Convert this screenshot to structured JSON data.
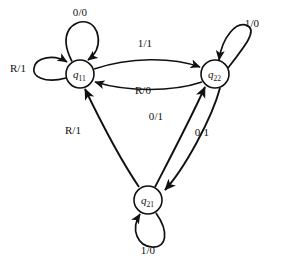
{
  "diagram": {
    "type": "finite-state-machine",
    "title": "",
    "background_color": "#ffffff",
    "stroke_color": "#111111",
    "states": [
      {
        "id": "q11",
        "label": "q",
        "subscript": "11",
        "full_label": "q11",
        "cx": 80,
        "cy": 74,
        "r": 14
      },
      {
        "id": "q22",
        "label": "q",
        "subscript": "22",
        "full_label": "q22",
        "cx": 215,
        "cy": 74,
        "r": 14
      },
      {
        "id": "q21",
        "label": "q",
        "subscript": "21",
        "full_label": "q21",
        "cx": 148,
        "cy": 200,
        "r": 14
      }
    ],
    "transitions": [
      {
        "id": "t-q11-self-top",
        "from": "q11",
        "to": "q11",
        "label": "0/0",
        "kind": "self-loop",
        "label_x": 80,
        "label_y": 12
      },
      {
        "id": "t-q11-self-left",
        "from": "q11",
        "to": "q11",
        "label": "R/1",
        "kind": "self-loop",
        "label_x": 18,
        "label_y": 68
      },
      {
        "id": "t-q11-q22",
        "from": "q11",
        "to": "q22",
        "label": "1/1",
        "kind": "curve",
        "label_x": 145,
        "label_y": 43
      },
      {
        "id": "t-q22-q11",
        "from": "q22",
        "to": "q11",
        "label": "R/0",
        "kind": "curve",
        "label_x": 143,
        "label_y": 90
      },
      {
        "id": "t-q22-self-right",
        "from": "q22",
        "to": "q22",
        "label": "1/0",
        "kind": "self-loop",
        "label_x": 252,
        "label_y": 23
      },
      {
        "id": "t-q21-q22",
        "from": "q21",
        "to": "q22",
        "label": "0/1",
        "kind": "curve",
        "label_x": 156,
        "label_y": 116
      },
      {
        "id": "t-q22-q21",
        "from": "q22",
        "to": "q21",
        "label": "0/1",
        "kind": "curve",
        "label_x": 202,
        "label_y": 132
      },
      {
        "id": "t-q21-q11",
        "from": "q21",
        "to": "q11",
        "label": "R/1",
        "kind": "curve",
        "label_x": 73,
        "label_y": 130
      },
      {
        "id": "t-q21-self-bottom",
        "from": "q21",
        "to": "q21",
        "label": "1/0",
        "kind": "self-loop",
        "label_x": 148,
        "label_y": 250
      }
    ]
  }
}
